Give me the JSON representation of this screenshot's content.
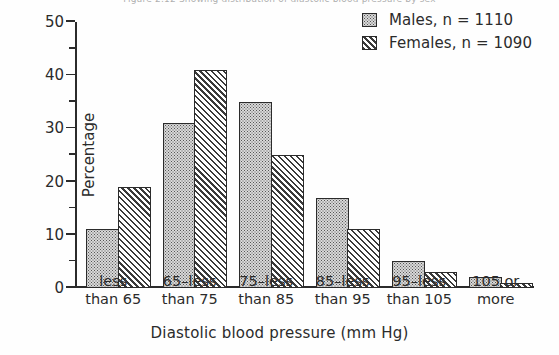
{
  "figure": {
    "caption_clipped": "Figure 2.12   Showing distribution of diastolic blood pressure by sex"
  },
  "chart_data": {
    "type": "bar",
    "title": "",
    "xlabel": "Diastolic blood pressure  (mm Hg)",
    "ylabel": "Percentage",
    "ylim": [
      0,
      50
    ],
    "yticks_major": [
      0,
      10,
      20,
      30,
      40,
      50
    ],
    "yticks_minor": [
      5,
      15,
      25,
      35,
      45
    ],
    "grid": false,
    "legend_position": "top-right",
    "categories": [
      "less\nthan 65",
      "65-less\nthan 75",
      "75-less\nthan 85",
      "85-less\nthan 95",
      "95-less\nthan 105",
      "105 or\nmore"
    ],
    "category_lines": [
      [
        "less",
        "than 65"
      ],
      [
        "65–less",
        "than 75"
      ],
      [
        "75–less",
        "than 85"
      ],
      [
        "85–less",
        "than 95"
      ],
      [
        "95–less",
        "than 105"
      ],
      [
        "105 or",
        "more"
      ]
    ],
    "series": [
      {
        "name": "Males",
        "n": 1110,
        "legend_label": "Males,   n = 1110",
        "pattern": "dotted",
        "fill": "#d8d8d8",
        "values": [
          11,
          31,
          35,
          17,
          5,
          2
        ]
      },
      {
        "name": "Females",
        "n": 1090,
        "legend_label": "Females,  n = 1090",
        "pattern": "diagonal-hatch",
        "fill": "#ffffff",
        "values": [
          19,
          41,
          25,
          11,
          3,
          1
        ]
      }
    ]
  },
  "axis": {
    "tick_labels": [
      "50",
      "40",
      "30",
      "20",
      "10",
      "0"
    ]
  },
  "colors": {
    "ink": "#2b2b2b",
    "male_fill": "#d8d8d8",
    "female_fill": "#ffffff",
    "background": "#fefefe"
  }
}
